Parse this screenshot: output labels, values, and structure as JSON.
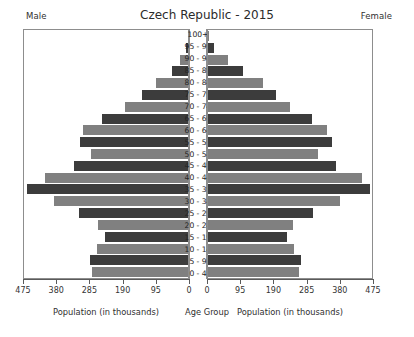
{
  "header": {
    "male_label": "Male",
    "female_label": "Female"
  },
  "chart_data": {
    "type": "bar",
    "subtype": "population-pyramid",
    "title": "Czech Republic - 2015",
    "categories": [
      "100+",
      "95 - 99",
      "90 - 94",
      "85 - 89",
      "80 - 84",
      "75 - 79",
      "70 - 74",
      "65 - 69",
      "60 - 64",
      "55 - 59",
      "50 - 54",
      "45 - 49",
      "40 - 44",
      "35 - 39",
      "30 - 34",
      "25 - 29",
      "20 - 24",
      "15 - 19",
      "10 - 14",
      "5 - 9",
      "0 - 4"
    ],
    "series": [
      {
        "name": "Male",
        "side": "left",
        "color": "#3c3c3c",
        "alt_color": "#808080",
        "values": [
          1,
          6,
          24,
          46,
          93,
          134,
          183,
          250,
          303,
          313,
          280,
          330,
          413,
          466,
          387,
          315,
          260,
          240,
          263,
          284,
          279
        ]
      },
      {
        "name": "Female",
        "side": "right",
        "color": "#3c3c3c",
        "alt_color": "#808080",
        "values": [
          3,
          18,
          59,
          100,
          160,
          196,
          238,
          302,
          345,
          360,
          320,
          370,
          445,
          470,
          383,
          303,
          246,
          228,
          250,
          270,
          264
        ]
      }
    ],
    "xticks": [
      0,
      95,
      190,
      285,
      380,
      475
    ],
    "xlim": [
      0,
      475
    ],
    "xlabel_left": "Population (in thousands)",
    "xlabel_center": "Age Group",
    "xlabel_right": "Population (in thousands)",
    "ylabel": "",
    "grid": false,
    "legend": "none"
  },
  "axis": {
    "male_ticklabels": [
      "475",
      "380",
      "285",
      "190",
      "95",
      "0"
    ],
    "female_ticklabels": [
      "0",
      "95",
      "190",
      "285",
      "380",
      "475"
    ],
    "title_left": "Population (in thousands)",
    "title_center": "Age Group",
    "title_right": "Population (in thousands)"
  }
}
